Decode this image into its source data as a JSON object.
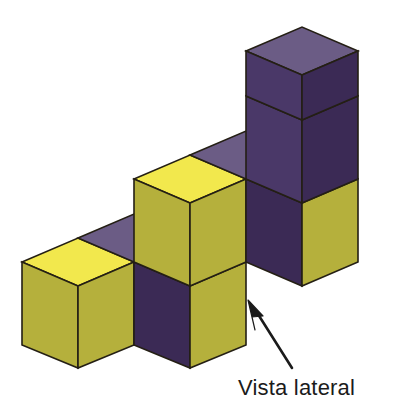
{
  "figure": {
    "title": "Vista lateral",
    "type": "isometric-cube-stack",
    "background_color": "#FFFFFF",
    "caption": {
      "text": "Vista lateral",
      "color": "#1B1B1B",
      "x": 238,
      "y": 377
    },
    "arrow": {
      "name": "view-direction-arrow",
      "color": "#1B1B1B",
      "tail_x": 292,
      "tail_y": 368,
      "head_x": 248,
      "head_y": 300,
      "description": "arrow pointing up-left toward the front-right faces of the stack"
    },
    "palette": {
      "top_yellow": "#F2E84D",
      "side_olive": "#B5B03C",
      "side_olive_dark": "#A8A338",
      "top_purple": "#6B5C85",
      "face_purple_dark": "#3B2A55",
      "face_purple_mid": "#4A3868",
      "outline": "#241F14"
    },
    "geometry": {
      "half_width": 56,
      "half_depth_rise": 28,
      "cube_height": 83,
      "origin_x": 78,
      "origin_y": 368,
      "note": "front-bottom vertex of the nearest (left) cube"
    },
    "structure": {
      "description": "Staircase of unit cubes rising from left to right",
      "columns": [
        {
          "name": "column-left",
          "height_in_cubes": 1
        },
        {
          "name": "column-middle",
          "height_in_cubes": 2
        },
        {
          "name": "column-right",
          "height_in_cubes": 3
        }
      ],
      "total_cubes_visible": 6
    },
    "faces": [
      {
        "name": "left-cube-top-face",
        "color_key": "top_yellow"
      },
      {
        "name": "left-cube-left-face",
        "color_key": "side_olive"
      },
      {
        "name": "left-cube-right-face",
        "color_key": "side_olive"
      },
      {
        "name": "middle-lower-left-face",
        "color_key": "face_purple_dark"
      },
      {
        "name": "middle-lower-right-face",
        "color_key": "side_olive"
      },
      {
        "name": "middle-upper-top-face",
        "color_key": "top_yellow"
      },
      {
        "name": "middle-upper-left-face",
        "color_key": "side_olive"
      },
      {
        "name": "middle-upper-right-face",
        "color_key": "side_olive"
      },
      {
        "name": "right-lower-left-face",
        "color_key": "face_purple_dark"
      },
      {
        "name": "right-lower-right-face",
        "color_key": "side_olive"
      },
      {
        "name": "right-middle-left-face",
        "color_key": "face_purple_mid"
      },
      {
        "name": "right-middle-right-face",
        "color_key": "face_purple_dark"
      },
      {
        "name": "right-top-top-face",
        "color_key": "top_purple"
      },
      {
        "name": "right-top-left-face",
        "color_key": "face_purple_mid"
      },
      {
        "name": "right-top-right-face",
        "color_key": "face_purple_dark"
      },
      {
        "name": "back-step-top-face-left",
        "color_key": "top_purple"
      },
      {
        "name": "back-step-top-face-right",
        "color_key": "top_purple"
      }
    ]
  }
}
